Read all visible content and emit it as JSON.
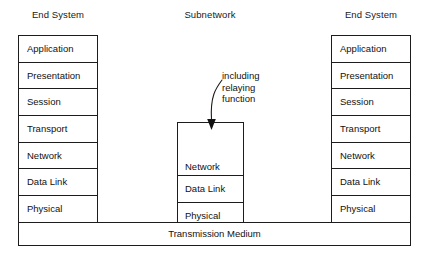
{
  "diagram": {
    "title_left": "End System",
    "title_middle": "Subnetwork",
    "title_right": "End System",
    "medium_label": "Transmission Medium",
    "annotation": {
      "line1": "including",
      "line2": "relaying",
      "line3": "function"
    },
    "end_system_layers": [
      "Application",
      "Presentation",
      "Session",
      "Transport",
      "Network",
      "Data Link",
      "Physical"
    ],
    "subnetwork_layers": [
      "Network",
      "Data Link",
      "Physical"
    ],
    "colors": {
      "background": "#ffffff",
      "stroke": "#1c1c1c",
      "text": "#111111"
    }
  }
}
